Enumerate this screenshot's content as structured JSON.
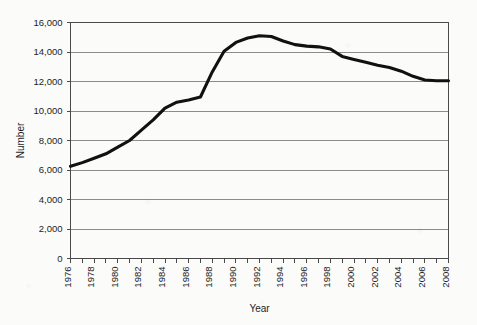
{
  "chart_data": {
    "type": "line",
    "title": "",
    "subtitle": "",
    "xlabel": "Year",
    "ylabel": "Number",
    "xlim": [
      1976,
      2008
    ],
    "ylim": [
      0,
      16000
    ],
    "ytick_step": 2000,
    "xtick_step": 1,
    "xtick_label_step": 2,
    "xtick_label_rotation": -90,
    "grid": "horizontal",
    "legend": "none",
    "line_color": "#111111",
    "gridline_color": "#8c8c8c",
    "frame_color": "#4a4a4a",
    "background_color": "#fbfbfa",
    "ytick_labels": [
      "0",
      "2,000",
      "4,000",
      "6,000",
      "8,000",
      "10,000",
      "12,000",
      "14,000",
      "16,000"
    ],
    "ytick_values": [
      0,
      2000,
      4000,
      6000,
      8000,
      10000,
      12000,
      14000,
      16000
    ],
    "xtick_labels": [
      "1976",
      "1978",
      "1980",
      "1982",
      "1984",
      "1986",
      "1988",
      "1990",
      "1992",
      "1994",
      "1996",
      "1998",
      "2000",
      "2002",
      "2004",
      "2006",
      "2008"
    ],
    "xtick_values": [
      1976,
      1978,
      1980,
      1982,
      1984,
      1986,
      1988,
      1990,
      1992,
      1994,
      1996,
      1998,
      2000,
      2002,
      2004,
      2006,
      2008
    ],
    "x": [
      1976,
      1977,
      1978,
      1979,
      1980,
      1981,
      1982,
      1983,
      1984,
      1985,
      1986,
      1987,
      1988,
      1989,
      1990,
      1991,
      1992,
      1993,
      1994,
      1995,
      1996,
      1997,
      1998,
      1999,
      2000,
      2001,
      2002,
      2003,
      2004,
      2005,
      2006,
      2007,
      2008
    ],
    "values": [
      6250,
      6500,
      6800,
      7100,
      7550,
      8000,
      8700,
      9400,
      10200,
      10600,
      10750,
      10950,
      12650,
      14050,
      14650,
      14950,
      15100,
      15050,
      14750,
      14500,
      14400,
      14350,
      14200,
      13700,
      13500,
      13300,
      13100,
      12950,
      12700,
      12350,
      12100,
      12050,
      12050
    ],
    "series": [
      {
        "name": "Number",
        "values": [
          6250,
          6500,
          6800,
          7100,
          7550,
          8000,
          8700,
          9400,
          10200,
          10600,
          10750,
          10950,
          12650,
          14050,
          14650,
          14950,
          15100,
          15050,
          14750,
          14500,
          14400,
          14350,
          14200,
          13700,
          13500,
          13300,
          13100,
          12950,
          12700,
          12350,
          12100,
          12050,
          12050
        ]
      }
    ]
  }
}
